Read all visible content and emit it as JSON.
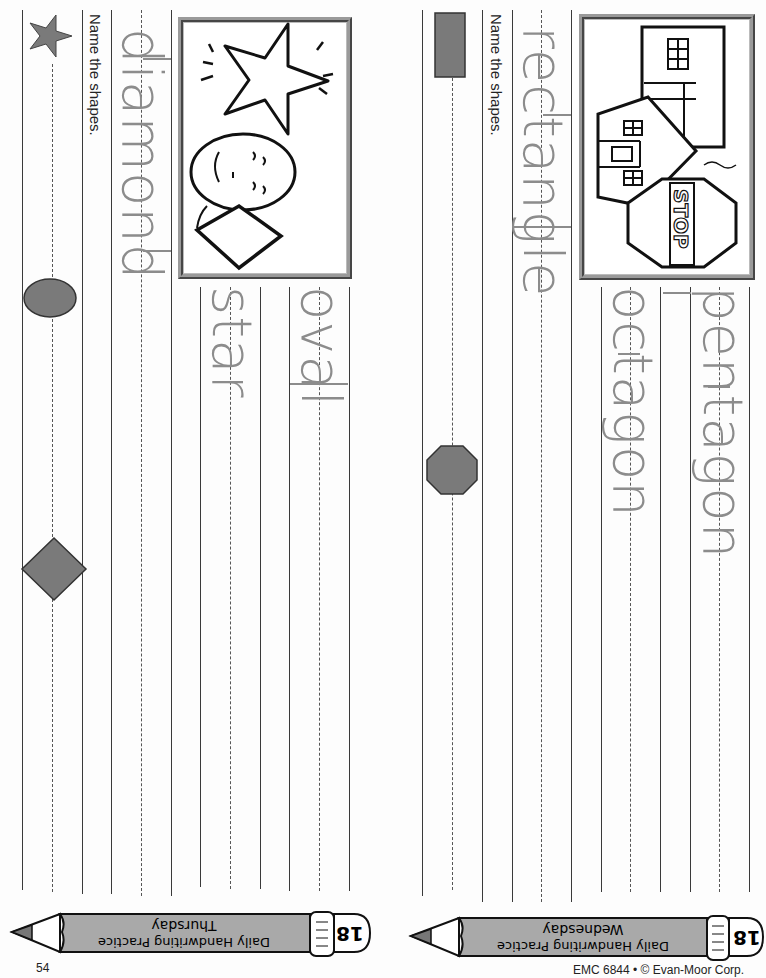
{
  "pages": [
    {
      "id": "thursday",
      "day": "Thursday",
      "title": "Daily Handwriting Practice",
      "badge_number": "18",
      "instruction": "Name the shapes.",
      "trace_words": [
        "diamond",
        "star",
        "oval"
      ],
      "picture_shapes": [
        "star",
        "oval",
        "diamond"
      ],
      "answer_shapes": [
        "star",
        "oval",
        "diamond"
      ],
      "page_number": "54"
    },
    {
      "id": "wednesday",
      "day": "Wednesday",
      "title": "Daily Handwriting Practice",
      "badge_number": "18",
      "instruction": "Name the shapes.",
      "trace_words": [
        "rectangle",
        "pentagon",
        "octagon"
      ],
      "picture_shapes": [
        "rectangle",
        "pentagon",
        "octagon"
      ],
      "picture_sign_text": "STOP",
      "answer_shapes": [
        "rectangle",
        "octagon"
      ],
      "footer": "EMC 6844 • © Evan-Moor Corp."
    }
  ],
  "colors": {
    "trace_gray": "#8c8c8c",
    "shape_fill": "#7a7a7a",
    "pencil_body": "#a9a9a9",
    "line": "#3a3a3a"
  }
}
